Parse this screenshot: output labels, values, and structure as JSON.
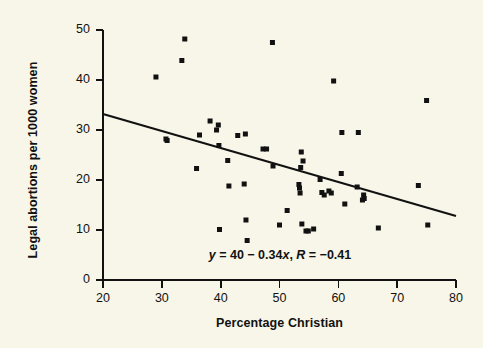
{
  "figure": {
    "background_color": "#f8f6e8",
    "foreground_color": "#111111",
    "marker_color": "#111111",
    "line_color": "#111111"
  },
  "annotation": {
    "equation_y": "y",
    "equation_rest": " = 40 − 0.34",
    "equation_x": "x",
    "equation_comma": ", ",
    "equation_r": "R",
    "equation_tail": " = −0.41",
    "full_text": "y = 40 − 0.34x, R = −0.41"
  },
  "chart_data": {
    "type": "scatter",
    "title": "",
    "xlabel": "Percentage Christian",
    "ylabel": "Legal abortions per 1000 women",
    "xlim": [
      20,
      80
    ],
    "ylim": [
      0,
      50
    ],
    "xticks": [
      20,
      30,
      40,
      50,
      60,
      70,
      80
    ],
    "yticks": [
      0,
      10,
      20,
      30,
      40,
      50
    ],
    "xtick_labels": [
      "20",
      "30",
      "40",
      "50",
      "60",
      "70",
      "80"
    ],
    "ytick_labels": [
      "0",
      "10",
      "20",
      "30",
      "40",
      "50"
    ],
    "grid": false,
    "legend": "none",
    "marker": "square",
    "marker_size_px": 5,
    "annotations": [
      {
        "text": "y = 40 − 0.34x, R = −0.41",
        "x": 50.5,
        "y": 4.3
      }
    ],
    "fit_line": {
      "type": "linear",
      "slope": -0.34,
      "intercept": 40,
      "R": -0.41,
      "x_start": 20,
      "y_start": 33.2,
      "x_end": 80,
      "y_end": 12.8
    },
    "points": [
      {
        "x": 29.0,
        "y": 40.6
      },
      {
        "x": 30.7,
        "y": 28.2
      },
      {
        "x": 30.9,
        "y": 27.9
      },
      {
        "x": 33.4,
        "y": 43.9
      },
      {
        "x": 33.9,
        "y": 48.2
      },
      {
        "x": 35.9,
        "y": 22.3
      },
      {
        "x": 36.4,
        "y": 29.0
      },
      {
        "x": 38.2,
        "y": 31.8
      },
      {
        "x": 39.3,
        "y": 30.0
      },
      {
        "x": 39.6,
        "y": 31.0
      },
      {
        "x": 39.7,
        "y": 26.9
      },
      {
        "x": 39.8,
        "y": 10.1
      },
      {
        "x": 41.2,
        "y": 23.9
      },
      {
        "x": 41.4,
        "y": 18.8
      },
      {
        "x": 42.9,
        "y": 28.9
      },
      {
        "x": 44.0,
        "y": 19.2
      },
      {
        "x": 44.2,
        "y": 29.2
      },
      {
        "x": 44.3,
        "y": 12.0
      },
      {
        "x": 44.5,
        "y": 7.9
      },
      {
        "x": 47.2,
        "y": 26.2
      },
      {
        "x": 47.8,
        "y": 26.2
      },
      {
        "x": 48.8,
        "y": 47.5
      },
      {
        "x": 48.9,
        "y": 22.8
      },
      {
        "x": 50.0,
        "y": 11.0
      },
      {
        "x": 51.3,
        "y": 13.9
      },
      {
        "x": 53.3,
        "y": 19.1
      },
      {
        "x": 53.4,
        "y": 18.4
      },
      {
        "x": 53.5,
        "y": 17.4
      },
      {
        "x": 53.6,
        "y": 22.5
      },
      {
        "x": 53.7,
        "y": 25.6
      },
      {
        "x": 53.8,
        "y": 11.2
      },
      {
        "x": 54.0,
        "y": 23.8
      },
      {
        "x": 54.5,
        "y": 9.8
      },
      {
        "x": 54.9,
        "y": 9.8
      },
      {
        "x": 55.8,
        "y": 10.2
      },
      {
        "x": 56.9,
        "y": 20.1
      },
      {
        "x": 57.2,
        "y": 17.5
      },
      {
        "x": 57.6,
        "y": 17.0
      },
      {
        "x": 58.4,
        "y": 17.8
      },
      {
        "x": 58.8,
        "y": 17.4
      },
      {
        "x": 59.2,
        "y": 39.8
      },
      {
        "x": 60.5,
        "y": 21.3
      },
      {
        "x": 60.6,
        "y": 29.5
      },
      {
        "x": 61.1,
        "y": 15.2
      },
      {
        "x": 63.2,
        "y": 18.6
      },
      {
        "x": 63.4,
        "y": 29.5
      },
      {
        "x": 64.1,
        "y": 16.0
      },
      {
        "x": 64.3,
        "y": 17.0
      },
      {
        "x": 64.4,
        "y": 16.3
      },
      {
        "x": 66.8,
        "y": 10.4
      },
      {
        "x": 73.6,
        "y": 18.9
      },
      {
        "x": 75.0,
        "y": 35.9
      },
      {
        "x": 75.2,
        "y": 11.0
      }
    ]
  }
}
